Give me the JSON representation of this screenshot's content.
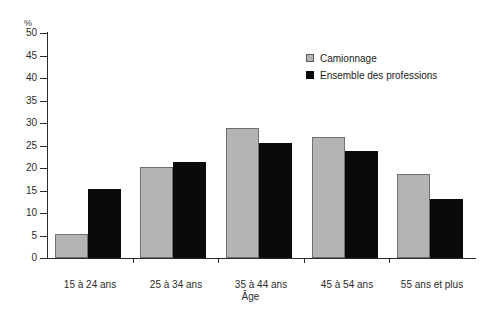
{
  "chart_data": {
    "type": "bar",
    "title": "",
    "subtitle": "",
    "xlabel": "Âge",
    "ylabel": "%",
    "ylim": [
      0,
      50
    ],
    "ytick_step": 5,
    "yticks": [
      "50",
      "45",
      "40",
      "35",
      "30",
      "25",
      "20",
      "15",
      "10",
      "5",
      "0"
    ],
    "grid": false,
    "legend_position": "top-right",
    "categories": [
      "15 à 24 ans",
      "25 à 34 ans",
      "35 à 44 ans",
      "45 à 54 ans",
      "55 ans et plus"
    ],
    "series": [
      {
        "name": "Camionnage",
        "color": "#b4b4b4",
        "values": [
          5.3,
          20.2,
          28.9,
          26.9,
          18.7
        ]
      },
      {
        "name": "Ensemble des professions",
        "color": "#0a0a0a",
        "values": [
          15.3,
          21.4,
          25.6,
          23.8,
          13.0
        ]
      }
    ]
  },
  "axes": {
    "y_unit_label": "%",
    "x_axis_title": "Âge"
  },
  "legend": {
    "items": [
      {
        "label": "Camionnage",
        "swatch": "light-square-swatch"
      },
      {
        "label": "Ensemble des professions",
        "swatch": "dark-square-swatch"
      }
    ]
  },
  "colors": {
    "light_bar": "#b4b4b4",
    "light_bar_border": "#6f6f6f",
    "dark_bar": "#0a0a0a",
    "axis": "#2b2b2b",
    "background": "#ffffff"
  }
}
